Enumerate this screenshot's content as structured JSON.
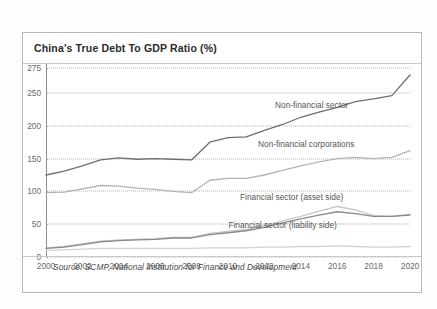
{
  "card": {
    "title": "China's True Debt To GDP Ratio (%)",
    "source": "Source: SCMP, National Institution for Finance and Development"
  },
  "colors": {
    "card_border": "#b9b9b9",
    "title_text": "#2b2b2b",
    "gridline": "#b0b0b0",
    "axis": "#8f8f8f",
    "non_financial_sector": "#6e6e6e",
    "non_financial_corporations": "#b4b4b4",
    "financial_asset_side": "#c6c6c6",
    "financial_liability_side": "#8a8a8a",
    "baseline_series": "#d2d2d2"
  },
  "chart_data": {
    "type": "line",
    "title": "China's True Debt To GDP Ratio (%)",
    "xlabel": "",
    "ylabel": "",
    "ylim": [
      0,
      275
    ],
    "xlim": [
      2000,
      2020
    ],
    "grid": true,
    "legend_position": "inline-annotations",
    "yticks": [
      0,
      50,
      100,
      150,
      200,
      250,
      275
    ],
    "xticks": [
      2000,
      2002,
      2004,
      2006,
      2008,
      2010,
      2012,
      2014,
      2016,
      2018,
      2020
    ],
    "x": [
      2000,
      2001,
      2002,
      2003,
      2004,
      2005,
      2006,
      2007,
      2008,
      2009,
      2010,
      2011,
      2012,
      2013,
      2014,
      2015,
      2016,
      2017,
      2018,
      2019,
      2020
    ],
    "series": [
      {
        "name": "Non-financial sector",
        "color": "#6e6e6e",
        "label_x": 2014.6,
        "label_y": 232,
        "values": [
          125,
          131,
          139,
          148,
          151,
          149,
          150,
          149,
          148,
          175,
          182,
          183,
          193,
          202,
          213,
          221,
          228,
          237,
          241,
          246,
          268
        ]
      },
      {
        "name": "Non-financial corporations",
        "color": "#b4b4b4",
        "label_x": 2014.3,
        "label_y": 172,
        "values": [
          98,
          99,
          104,
          109,
          108,
          105,
          103,
          100,
          98,
          117,
          120,
          120,
          125,
          132,
          139,
          145,
          150,
          152,
          150,
          152,
          162
        ]
      },
      {
        "name": "Financial sector (asset side)",
        "color": "#c6c6c6",
        "label_x": 2013.5,
        "label_y": 92,
        "values": [
          14,
          16,
          20,
          24,
          26,
          27,
          28,
          30,
          30,
          36,
          39,
          42,
          48,
          55,
          62,
          70,
          77,
          72,
          63,
          62,
          65
        ]
      },
      {
        "name": "Financial sector (liability side)",
        "color": "#8a8a8a",
        "label_x": 2013.0,
        "label_y": 49,
        "values": [
          13,
          15,
          19,
          23,
          25,
          26,
          27,
          29,
          29,
          34,
          37,
          40,
          45,
          52,
          58,
          64,
          69,
          66,
          62,
          62,
          64
        ]
      },
      {
        "name": "baseline",
        "color": "#d2d2d2",
        "label_x": null,
        "label_y": null,
        "values": [
          10,
          11,
          12,
          13,
          13,
          13,
          13,
          13,
          13,
          14,
          14,
          14,
          15,
          15,
          16,
          16,
          17,
          16,
          15,
          15,
          16
        ]
      }
    ]
  }
}
